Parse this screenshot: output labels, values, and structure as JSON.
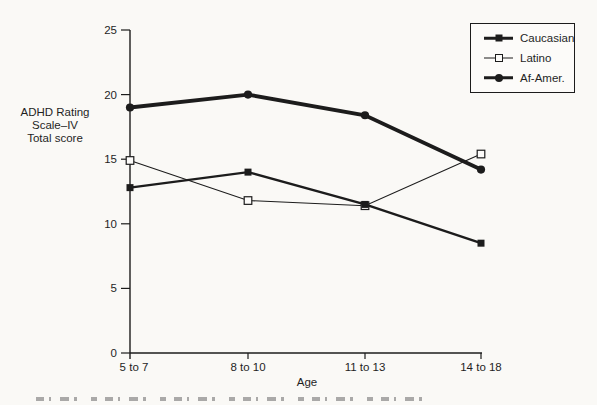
{
  "figure": {
    "background_color": "#faf9f6",
    "ink_color": "#1c1c1c"
  },
  "chart_data": {
    "type": "line",
    "title": "",
    "xlabel": "Age",
    "ylabel_lines": [
      "ADHD Rating",
      "Scale–IV",
      "Total score"
    ],
    "categories": [
      "5 to 7",
      "8 to 10",
      "11 to 13",
      "14 to 18"
    ],
    "series": [
      {
        "name": "Caucasian",
        "marker": "filled-square",
        "line_weight": "medium",
        "values": [
          12.8,
          14.0,
          11.5,
          8.5
        ]
      },
      {
        "name": "Latino",
        "marker": "open-square",
        "line_weight": "thin",
        "values": [
          14.9,
          11.8,
          11.4,
          15.4
        ]
      },
      {
        "name": "Af-Amer.",
        "marker": "filled-circle",
        "line_weight": "thick",
        "values": [
          19.0,
          20.0,
          18.4,
          14.2
        ]
      }
    ],
    "ylim": [
      0,
      25
    ],
    "yticks": [
      0,
      5,
      10,
      15,
      20,
      25
    ],
    "grid": false,
    "legend_position": "top-right"
  }
}
